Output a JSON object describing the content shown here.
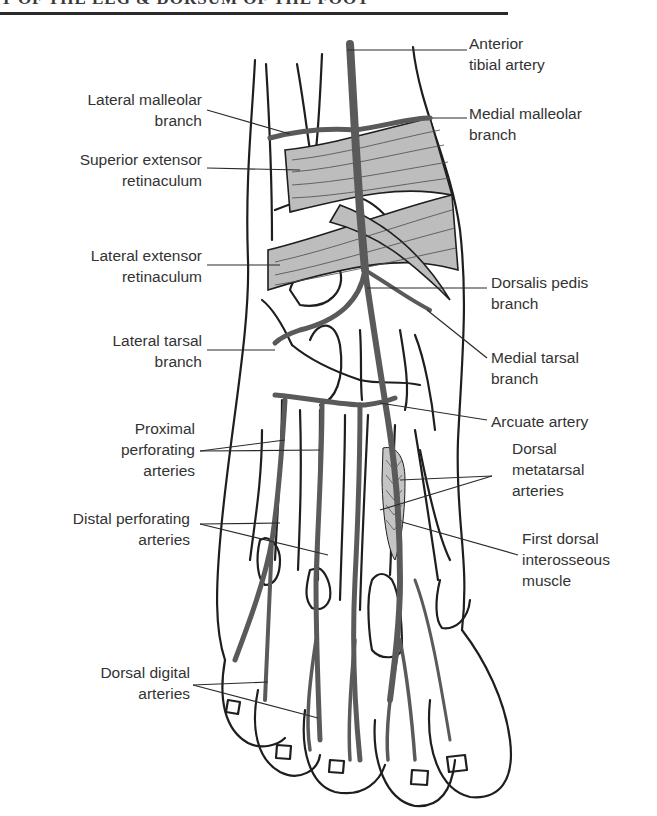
{
  "page": {
    "header_text": "Y OF THE LEG & DORSUM OF THE FOOT"
  },
  "figure": {
    "colors": {
      "outline": "#1e1e1e",
      "artery": "#5a5a5a",
      "retinaculum": "#bdbdbd",
      "muscle": "#c4c4c4",
      "leader_line": "#2a2a2a"
    },
    "labels_left": [
      {
        "id": "lateral-malleolar-branch",
        "lines": [
          "Lateral malleolar",
          "branch"
        ]
      },
      {
        "id": "superior-extensor-retinaculum",
        "lines": [
          "Superior extensor",
          "retinaculum"
        ]
      },
      {
        "id": "lateral-extensor-retinaculum",
        "lines": [
          "Lateral extensor",
          "retinaculum"
        ]
      },
      {
        "id": "lateral-tarsal-branch",
        "lines": [
          "Lateral tarsal",
          "branch"
        ]
      },
      {
        "id": "proximal-perforating-arteries",
        "lines": [
          "Proximal",
          "perforating",
          "arteries"
        ]
      },
      {
        "id": "distal-perforating-arteries",
        "lines": [
          "Distal perforating",
          "arteries"
        ]
      },
      {
        "id": "dorsal-digital-arteries",
        "lines": [
          "Dorsal digital",
          "arteries"
        ]
      }
    ],
    "labels_right": [
      {
        "id": "anterior-tibial-artery",
        "lines": [
          "Anterior",
          "tibial artery"
        ]
      },
      {
        "id": "medial-malleolar-branch",
        "lines": [
          "Medial malleolar",
          "branch"
        ]
      },
      {
        "id": "dorsalis-pedis-branch",
        "lines": [
          "Dorsalis pedis",
          "branch"
        ]
      },
      {
        "id": "medial-tarsal-branch",
        "lines": [
          "Medial tarsal",
          "branch"
        ]
      },
      {
        "id": "arcuate-artery",
        "lines": [
          "Arcuate artery"
        ]
      },
      {
        "id": "dorsal-metatarsal-arteries",
        "lines": [
          "Dorsal",
          "metatarsal",
          "arteries"
        ]
      },
      {
        "id": "first-dorsal-interosseous-muscle",
        "lines": [
          "First dorsal",
          "interosseous",
          "muscle"
        ]
      }
    ]
  }
}
